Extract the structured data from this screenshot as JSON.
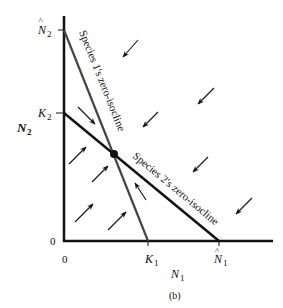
{
  "figure": {
    "caption": "(b)",
    "x_axis": {
      "label": "N",
      "label_sub": "1",
      "origin_label": "0",
      "ticks": [
        {
          "name": "K",
          "sub": "1",
          "hat": false
        },
        {
          "name": "N",
          "sub": "1",
          "hat": true
        }
      ]
    },
    "y_axis": {
      "label": "N",
      "label_sub": "2",
      "origin_label": "0",
      "ticks": [
        {
          "name": "N",
          "sub": "2",
          "hat": true
        },
        {
          "name": "K",
          "sub": "2",
          "hat": false
        }
      ]
    },
    "isoclines": [
      {
        "label": "Species 1's zero-isocline",
        "color": "#444444"
      },
      {
        "label": "Species 2's zero-isocline",
        "color": "#111111"
      }
    ],
    "equilibrium_point": "stable equilibrium",
    "arrow_color": "#111111"
  }
}
